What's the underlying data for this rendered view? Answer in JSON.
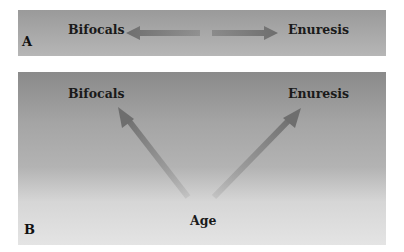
{
  "panel_a": {
    "letter": "A",
    "left_label": "Bifocals",
    "right_label": "Enuresis",
    "relation": "bidirectional-correlation"
  },
  "panel_b": {
    "letter": "B",
    "left_label": "Bifocals",
    "right_label": "Enuresis",
    "source_label": "Age",
    "relation": "common-cause"
  },
  "colors": {
    "arrow": "#6e6e6e",
    "text": "#1a1a1a"
  }
}
